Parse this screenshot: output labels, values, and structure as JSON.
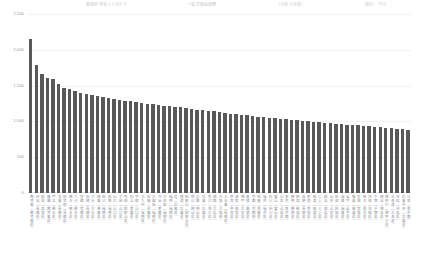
{
  "title": {
    "segments": [
      "都道府県別 1人当たり",
      "一般診療医療費",
      "（令和元年度）",
      "単位：千円"
    ]
  },
  "axis": {
    "y_ticks": [
      "2,500",
      "2,000",
      "1,500",
      "1,000",
      "500",
      "0"
    ],
    "y_values": [
      2500,
      2000,
      1500,
      1000,
      500,
      0
    ]
  },
  "colors": {
    "bar": "#595959",
    "grid": "#f0f0f2",
    "tick_text": "#9a9aa2",
    "label_text": "#8d8d95",
    "background": "#ffffff"
  },
  "chart_data": {
    "type": "bar",
    "xlabel": "",
    "ylabel": "",
    "ylim": [
      0,
      2500
    ],
    "grid": true,
    "legend": "none",
    "categories": [
      "鹿児島（鹿児島県）",
      "対馬（長崎県）",
      "高知（高知県）",
      "薩摩（鹿児島県）",
      "芦北（熊本県）",
      "五島（長崎県）",
      "佐世保（長崎県）",
      "熊本（熊本県）",
      "八代（熊本県）",
      "宮崎（宮崎県）",
      "長崎（長崎県）",
      "大分（大分県）",
      "徳島（徳島県）",
      "田川（福岡県）",
      "飯塚（福岡県）",
      "山口（山口県）",
      "下関（山口県）",
      "有田（和歌山県）",
      "松山（愛媛県）",
      "宇部（山口県）",
      "北九州（福岡県）",
      "佐賀（佐賀県）",
      "久留米（福岡県）",
      "今治（愛媛県）",
      "大牟田（福岡県）",
      "福岡（福岡県）",
      "呉（広島県）",
      "尾道（広島県）",
      "和歌山（和歌山県）",
      "岡山（岡山県）",
      "倉敷（岡山県）",
      "広島（広島県）",
      "香川（香川県）",
      "姫路（兵庫県）",
      "大阪（大阪府）",
      "上五島（長崎県）",
      "奈良（奈良県）",
      "鳥取（鳥取県）",
      "神戸（兵庫県）",
      "島根（島根県）",
      "京都（京都府）",
      "滋賀（滋賀県）",
      "福井（福井県）",
      "石川（石川県）",
      "富山（富山県）",
      "山梨（山梨県）",
      "東京（東京都）",
      "静岡（静岡県）",
      "新潟（新潟県）",
      "長野（長野県）",
      "愛知（愛知県）",
      "岐阜（岐阜県）",
      "三重（三重県）",
      "群馬（群馬県）",
      "山形（山形県）",
      "秋田（秋田県）",
      "福島（福島県）",
      "岩手（岩手県）",
      "青森（青森県）",
      "宮城（宮城県）",
      "栃木（栃木県）",
      "茨城（茨城県）",
      "千葉（千葉県）",
      "埼玉（埼玉県）",
      "神奈川（神奈川県）",
      "北海道（北海道）",
      "沖縄（沖縄県）",
      "広島中央（広島県）",
      "江東（東京都）"
    ],
    "values": [
      2150,
      1790,
      1660,
      1600,
      1595,
      1520,
      1470,
      1450,
      1430,
      1400,
      1385,
      1370,
      1355,
      1340,
      1325,
      1315,
      1300,
      1290,
      1280,
      1270,
      1260,
      1250,
      1240,
      1230,
      1220,
      1215,
      1205,
      1195,
      1185,
      1175,
      1165,
      1155,
      1150,
      1140,
      1130,
      1120,
      1110,
      1100,
      1090,
      1085,
      1075,
      1065,
      1060,
      1050,
      1045,
      1035,
      1030,
      1020,
      1015,
      1008,
      1000,
      995,
      988,
      980,
      975,
      968,
      960,
      955,
      950,
      945,
      940,
      932,
      925,
      920,
      915,
      908,
      900,
      892,
      880
    ]
  }
}
